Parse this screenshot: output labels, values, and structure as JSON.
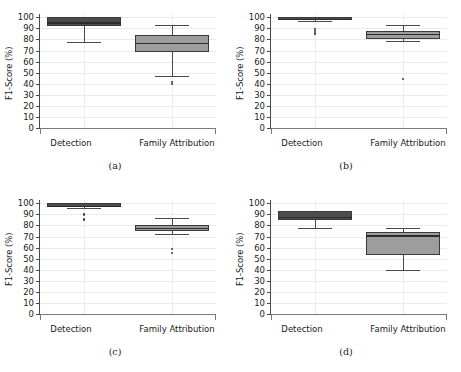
{
  "figure": {
    "ylabel": "F1-Score (%)",
    "y_ticks": [
      0,
      10,
      20,
      30,
      40,
      50,
      60,
      70,
      80,
      90,
      100
    ],
    "categories": [
      "Detection",
      "Family Attribution"
    ],
    "colors": {
      "detection_box": "#4d4d4d",
      "family_attribution_box": "#9d9d9d",
      "line": "#3a3a3a",
      "grid": "#ebebeb",
      "background": "#ffffff"
    }
  },
  "chart_data": [
    {
      "type": "box",
      "panel": "a",
      "caption": "(a)",
      "title": "",
      "xlabel": "",
      "ylabel": "F1-Score (%)",
      "ylim": [
        0,
        103
      ],
      "yticks": [
        0,
        10,
        20,
        30,
        40,
        50,
        60,
        70,
        80,
        90,
        100
      ],
      "grid": true,
      "legend": "none",
      "categories": [
        "Detection",
        "Family Attribution"
      ],
      "boxes": [
        {
          "label": "Detection",
          "whisker_low": 78.0,
          "q1": 92.0,
          "median": 95.5,
          "q3": 100.0,
          "whisker_high": 100.0,
          "outliers": []
        },
        {
          "label": "Family Attribution",
          "whisker_low": 47.0,
          "q1": 69.0,
          "median": 77.0,
          "q3": 84.0,
          "whisker_high": 93.0,
          "outliers": [
            41.5,
            40.0
          ]
        }
      ]
    },
    {
      "type": "box",
      "panel": "b",
      "caption": "(b)",
      "title": "",
      "xlabel": "",
      "ylabel": "F1-Score (%)",
      "ylim": [
        0,
        103
      ],
      "yticks": [
        0,
        10,
        20,
        30,
        40,
        50,
        60,
        70,
        80,
        90,
        100
      ],
      "grid": true,
      "legend": "none",
      "categories": [
        "Detection",
        "Family Attribution"
      ],
      "boxes": [
        {
          "label": "Detection",
          "whisker_low": 97.0,
          "q1": 98.0,
          "median": 98.5,
          "q3": 100.0,
          "whisker_high": 100.0,
          "outliers": [
            89.0,
            87.5,
            86.0,
            85.0
          ]
        },
        {
          "label": "Family Attribution",
          "whisker_low": 79.0,
          "q1": 80.5,
          "median": 85.0,
          "q3": 87.5,
          "whisker_high": 93.0,
          "outliers": [
            44.0
          ]
        }
      ]
    },
    {
      "type": "box",
      "panel": "c",
      "caption": "(c)",
      "title": "",
      "xlabel": "",
      "ylabel": "F1-Score (%)",
      "ylim": [
        0,
        103
      ],
      "yticks": [
        0,
        10,
        20,
        30,
        40,
        50,
        60,
        70,
        80,
        90,
        100
      ],
      "grid": true,
      "legend": "none",
      "categories": [
        "Detection",
        "Family Attribution"
      ],
      "boxes": [
        {
          "label": "Detection",
          "whisker_low": 96.0,
          "q1": 97.0,
          "median": 97.5,
          "q3": 100.0,
          "whisker_high": 100.0,
          "outliers": [
            90.5,
            89.0,
            86.0,
            85.0
          ]
        },
        {
          "label": "Family Attribution",
          "whisker_low": 72.0,
          "q1": 75.0,
          "median": 78.0,
          "q3": 80.0,
          "whisker_high": 87.0,
          "outliers": [
            59.0,
            55.0
          ]
        }
      ]
    },
    {
      "type": "box",
      "panel": "d",
      "caption": "(d)",
      "title": "",
      "xlabel": "",
      "ylabel": "F1-Score (%)",
      "ylim": [
        0,
        103
      ],
      "yticks": [
        0,
        10,
        20,
        30,
        40,
        50,
        60,
        70,
        80,
        90,
        100
      ],
      "grid": true,
      "legend": "none",
      "categories": [
        "Detection",
        "Family Attribution"
      ],
      "boxes": [
        {
          "label": "Detection",
          "whisker_low": 77.5,
          "q1": 85.0,
          "median": 88.0,
          "q3": 93.0,
          "whisker_high": 93.5,
          "outliers": []
        },
        {
          "label": "Family Attribution",
          "whisker_low": 40.0,
          "q1": 53.0,
          "median": 71.0,
          "q3": 74.0,
          "whisker_high": 78.0,
          "outliers": []
        }
      ]
    }
  ]
}
